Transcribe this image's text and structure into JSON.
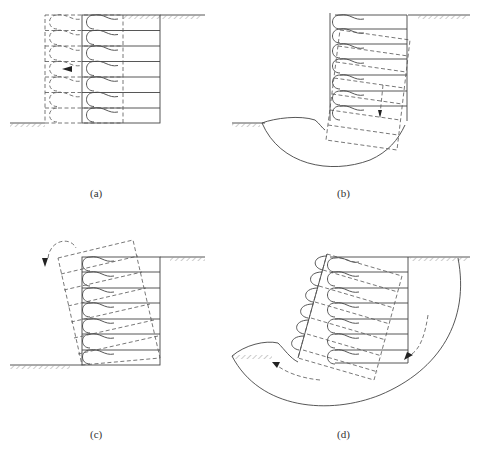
{
  "figure": {
    "type": "reinforced soil wall failure modes",
    "panels": [
      {
        "id": "a",
        "label": "(a)",
        "mode": "sliding"
      },
      {
        "id": "b",
        "label": "(b)",
        "mode": "bearing capacity / foundation failure"
      },
      {
        "id": "c",
        "label": "(c)",
        "mode": "overturning"
      },
      {
        "id": "d",
        "label": "(d)",
        "mode": "deep-seated global slip"
      }
    ],
    "layers_per_wall": 7,
    "colors": {
      "line": "#444444",
      "hatch": "#aaaaaa",
      "background": "#ffffff"
    }
  }
}
